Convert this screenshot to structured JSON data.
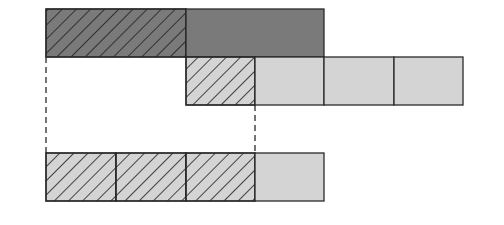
{
  "diagram": {
    "colors": {
      "background": "#ffffff",
      "dark_fill": "#7a7a7a",
      "light_fill": "#d4d4d4",
      "stroke": "#2a2a2a",
      "hatch": "#1e1e1e"
    },
    "rows": [
      {
        "name": "top-row",
        "cells": [
          {
            "x": 46,
            "y": 9,
            "w": 140,
            "h": 48,
            "fill": "dark",
            "hatched": true
          },
          {
            "x": 186,
            "y": 9,
            "w": 138,
            "h": 48,
            "fill": "dark",
            "hatched": false
          }
        ]
      },
      {
        "name": "middle-row",
        "cells": [
          {
            "x": 186,
            "y": 57,
            "w": 69,
            "h": 48,
            "fill": "light",
            "hatched": true
          },
          {
            "x": 255,
            "y": 57,
            "w": 69,
            "h": 48,
            "fill": "light",
            "hatched": false
          },
          {
            "x": 324,
            "y": 57,
            "w": 70,
            "h": 48,
            "fill": "light",
            "hatched": false
          },
          {
            "x": 394,
            "y": 57,
            "w": 69,
            "h": 48,
            "fill": "light",
            "hatched": false
          }
        ]
      },
      {
        "name": "bottom-row",
        "cells": [
          {
            "x": 46,
            "y": 153,
            "w": 70,
            "h": 48,
            "fill": "light",
            "hatched": true
          },
          {
            "x": 116,
            "y": 153,
            "w": 70,
            "h": 48,
            "fill": "light",
            "hatched": true
          },
          {
            "x": 186,
            "y": 153,
            "w": 69,
            "h": 48,
            "fill": "light",
            "hatched": true
          },
          {
            "x": 255,
            "y": 153,
            "w": 69,
            "h": 48,
            "fill": "light",
            "hatched": false
          }
        ]
      }
    ],
    "dashed_lines": [
      {
        "name": "left-guide",
        "x": 46,
        "y1": 57,
        "y2": 153
      },
      {
        "name": "right-guide",
        "x": 255,
        "y1": 105,
        "y2": 153
      }
    ]
  }
}
